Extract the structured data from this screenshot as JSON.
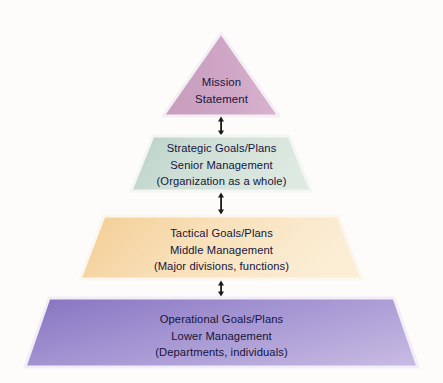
{
  "diagram": {
    "background_color": "#fdfcfa",
    "text_color": "#14143c",
    "tiers": [
      {
        "id": "mission",
        "shape": "triangle",
        "lines": [
          "Mission",
          "Statement"
        ],
        "fill_start": "#c9a0c0",
        "fill_end": "#d9b6cf",
        "border_color": "#f3eef2"
      },
      {
        "id": "strategic",
        "shape": "trapezoid",
        "lines": [
          "Strategic Goals/Plans",
          "Senior Management",
          "(Organization as a whole)"
        ],
        "fill_start": "#bcd3c9",
        "fill_end": "#dfe9e2",
        "border_color": "#f2f5f2"
      },
      {
        "id": "tactical",
        "shape": "trapezoid",
        "lines": [
          "Tactical Goals/Plans",
          "Middle Management",
          "(Major divisions, functions)"
        ],
        "fill_start": "#f4cf97",
        "fill_end": "#fbeed4",
        "border_color": "#fbf6ec"
      },
      {
        "id": "operational",
        "shape": "trapezoid",
        "lines": [
          "Operational Goals/Plans",
          "Lower Management",
          "(Departments, individuals)"
        ],
        "fill_start": "#8b79c4",
        "fill_end": "#c3b6e0",
        "border_color": "#f0edf7"
      }
    ],
    "connectors": [
      {
        "id": "connector-mission-strategic",
        "type": "double-headed-arrow"
      },
      {
        "id": "connector-strategic-tactical",
        "type": "double-headed-arrow"
      },
      {
        "id": "connector-tactical-operational",
        "type": "double-headed-arrow"
      }
    ],
    "connector_color": "#1a1a1a"
  }
}
